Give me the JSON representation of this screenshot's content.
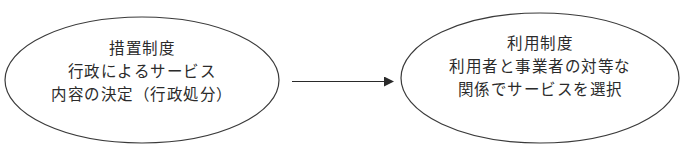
{
  "diagram": {
    "type": "flow",
    "direction": "left-to-right",
    "colors": {
      "stroke": "#3a3a3a",
      "text": "#2b2b2b",
      "background": "#ffffff"
    },
    "nodes": [
      {
        "id": "措置制度",
        "shape": "ellipse",
        "lines": [
          "措置制度",
          "行政によるサービス",
          "内容の決定（行政処分）"
        ]
      },
      {
        "id": "利用制度",
        "shape": "ellipse",
        "lines": [
          "利用制度",
          "利用者と事業者の対等な",
          "関係でサービスを選択"
        ]
      }
    ],
    "edges": [
      {
        "from": "措置制度",
        "to": "利用制度",
        "style": "solid-arrow"
      }
    ]
  }
}
